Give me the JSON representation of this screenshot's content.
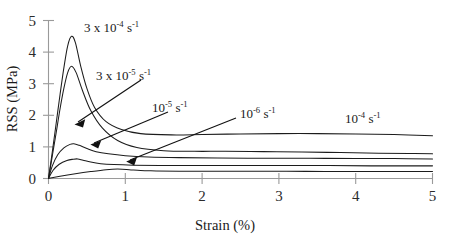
{
  "chart_data": {
    "type": "line",
    "title": "",
    "xlabel": "Strain (%)",
    "ylabel": "RSS (MPa)",
    "xlim": [
      0,
      5
    ],
    "ylim": [
      0,
      5
    ],
    "xticks": [
      "0",
      "1",
      "2",
      "3",
      "4",
      "5"
    ],
    "yticks": [
      "0",
      "1",
      "2",
      "3",
      "4",
      "5"
    ],
    "grid": false,
    "legend": "none (inline annotations with leader lines)",
    "series": [
      {
        "name": "3 x 10^-4 s^-1",
        "label_mantissa": "3 x 10",
        "label_exponent": "-4",
        "label_unit": "s",
        "label_unit_exponent": "-1",
        "peak_strain": 0.3,
        "peak_rss": 4.5,
        "plateau_rss": 1.35,
        "x": [
          0,
          0.05,
          0.1,
          0.15,
          0.2,
          0.25,
          0.3,
          0.35,
          0.42,
          0.5,
          0.6,
          0.75,
          0.95,
          1.2,
          1.6,
          2.0,
          2.5,
          3.0,
          3.5,
          4.0,
          4.5,
          5.0
        ],
        "y": [
          0,
          0.85,
          1.75,
          2.65,
          3.5,
          4.2,
          4.5,
          4.3,
          3.55,
          2.85,
          2.25,
          1.8,
          1.55,
          1.42,
          1.38,
          1.39,
          1.41,
          1.42,
          1.42,
          1.41,
          1.39,
          1.35
        ]
      },
      {
        "name": "3 x 10^-5 s^-1",
        "label_mantissa": "3 x 10",
        "label_exponent": "-5",
        "label_unit": "s",
        "label_unit_exponent": "-1",
        "peak_strain": 0.3,
        "peak_rss": 3.55,
        "plateau_rss": 0.78,
        "x": [
          0,
          0.05,
          0.1,
          0.15,
          0.2,
          0.25,
          0.3,
          0.36,
          0.44,
          0.55,
          0.7,
          0.9,
          1.15,
          1.5,
          1.9,
          2.3,
          2.8,
          3.3,
          3.8,
          4.3,
          4.7,
          5.0
        ],
        "y": [
          0,
          0.72,
          1.45,
          2.2,
          2.85,
          3.35,
          3.55,
          3.35,
          2.8,
          2.15,
          1.6,
          1.2,
          0.98,
          0.88,
          0.86,
          0.86,
          0.85,
          0.84,
          0.82,
          0.8,
          0.79,
          0.78
        ]
      },
      {
        "name": "10^-5 s^-1",
        "label_mantissa": "10",
        "label_exponent": "-5",
        "label_unit": "s",
        "label_unit_exponent": "-1",
        "peak_strain": 0.32,
        "peak_rss": 1.1,
        "plateau_rss": 0.62,
        "x": [
          0,
          0.05,
          0.12,
          0.2,
          0.28,
          0.33,
          0.4,
          0.5,
          0.62,
          0.78,
          1.0,
          1.3,
          1.7,
          2.2,
          2.8,
          3.4,
          4.0,
          4.5,
          5.0
        ],
        "y": [
          0,
          0.4,
          0.75,
          0.97,
          1.08,
          1.1,
          1.05,
          0.95,
          0.85,
          0.78,
          0.72,
          0.68,
          0.66,
          0.65,
          0.64,
          0.64,
          0.63,
          0.63,
          0.62
        ]
      },
      {
        "name": "10^-6 s^-1",
        "label_mantissa": "10",
        "label_exponent": "-6",
        "label_unit": "s",
        "label_unit_exponent": "-1",
        "peak_strain": 0.38,
        "peak_rss": 0.62,
        "plateau_rss": 0.4,
        "x": [
          0,
          0.06,
          0.14,
          0.24,
          0.32,
          0.38,
          0.45,
          0.55,
          0.68,
          0.85,
          1.1,
          1.45,
          1.9,
          2.45,
          3.05,
          3.65,
          4.2,
          4.7,
          5.0
        ],
        "y": [
          0,
          0.26,
          0.45,
          0.57,
          0.61,
          0.62,
          0.58,
          0.52,
          0.47,
          0.44,
          0.42,
          0.41,
          0.41,
          0.41,
          0.41,
          0.41,
          0.4,
          0.4,
          0.4
        ]
      },
      {
        "name": "10^-4 s^-1",
        "label_mantissa": "10",
        "label_exponent": "-4",
        "label_unit": "s",
        "label_unit_exponent": "-1",
        "peak_strain": 0.9,
        "peak_rss": 0.3,
        "plateau_rss": 0.22,
        "x": [
          0,
          0.15,
          0.35,
          0.55,
          0.75,
          0.9,
          1.05,
          1.2,
          1.4,
          1.7,
          2.1,
          2.6,
          3.1,
          3.6,
          4.1,
          4.6,
          5.0
        ],
        "y": [
          0,
          0.07,
          0.15,
          0.22,
          0.28,
          0.3,
          0.28,
          0.25,
          0.24,
          0.23,
          0.23,
          0.23,
          0.23,
          0.22,
          0.22,
          0.22,
          0.22
        ]
      }
    ],
    "annotations": [
      {
        "id": "ann-3e-4",
        "mantissa": "3 x 10",
        "exponent": "-4",
        "unit": "s",
        "unit_exponent": "-1",
        "leader": false
      },
      {
        "id": "ann-3e-5",
        "mantissa": "3 x 10",
        "exponent": "-5",
        "unit": "s",
        "unit_exponent": "-1",
        "leader": true
      },
      {
        "id": "ann-1e-5",
        "mantissa": "10",
        "exponent": "-5",
        "unit": "s",
        "unit_exponent": "-1",
        "leader": true
      },
      {
        "id": "ann-1e-6",
        "mantissa": "10",
        "exponent": "-6",
        "unit": "s",
        "unit_exponent": "-1",
        "leader": true
      },
      {
        "id": "ann-1e-4",
        "mantissa": "10",
        "exponent": "-4",
        "unit": "s",
        "unit_exponent": "-1",
        "leader": false
      }
    ],
    "colors": {
      "curve": "#1c1c1c",
      "axis": "#9a9a9a",
      "text": "#1a1a1a",
      "background": "#ffffff"
    }
  }
}
